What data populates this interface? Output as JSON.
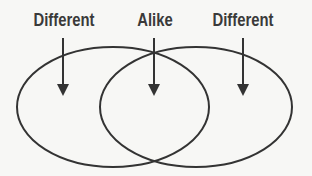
{
  "diagram": {
    "type": "venn",
    "labels": [
      {
        "text": "Different",
        "x": 64
      },
      {
        "text": "Alike",
        "x": 155
      },
      {
        "text": "Different",
        "x": 243
      }
    ],
    "circles": [
      {
        "name": "left-set",
        "cx": 113,
        "cy": 107,
        "rx": 96,
        "ry": 60
      },
      {
        "name": "right-set",
        "cx": 196,
        "cy": 107,
        "rx": 96,
        "ry": 60
      }
    ],
    "arrows": [
      {
        "target": "left-only-region",
        "x": 63,
        "y1": 40,
        "y2": 96
      },
      {
        "target": "overlap-region",
        "x": 154,
        "y1": 40,
        "y2": 96
      },
      {
        "target": "right-only-region",
        "x": 243,
        "y1": 40,
        "y2": 96
      }
    ],
    "colors": {
      "stroke": "#333333",
      "text": "#3a3a3a",
      "background": "#f7f7f5"
    }
  }
}
